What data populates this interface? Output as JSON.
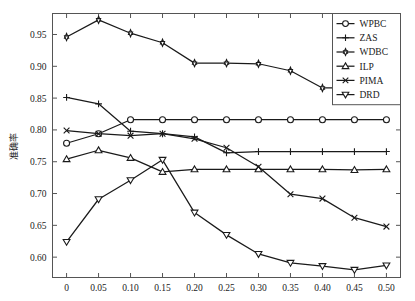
{
  "chart_data": {
    "type": "line",
    "title": "",
    "xlabel": "",
    "ylabel": "准确率",
    "x": [
      0,
      0.05,
      0.1,
      0.15,
      0.2,
      0.25,
      0.3,
      0.35,
      0.4,
      0.45,
      0.5
    ],
    "xticklabels": [
      "0",
      "0.05",
      "0.10",
      "0.15",
      "0.20",
      "0.25",
      "0.30",
      "0.35",
      "0.40",
      "0.45",
      "0.50"
    ],
    "yticks": [
      0.6,
      0.65,
      0.7,
      0.75,
      0.8,
      0.85,
      0.9,
      0.95
    ],
    "yticklabels": [
      "0.60",
      "0.65",
      "0.70",
      "0.75",
      "0.80",
      "0.85",
      "0.90",
      "0.95"
    ],
    "xlim": [
      -0.022,
      0.522
    ],
    "ylim": [
      0.568,
      0.983
    ],
    "grid": false,
    "legend_position": "upper right",
    "series": [
      {
        "name": "WPBC",
        "marker": "circle",
        "color": "#1a1a1a",
        "values": [
          0.779,
          0.794,
          0.816,
          0.816,
          0.816,
          0.816,
          0.816,
          0.816,
          0.816,
          0.816,
          0.816
        ]
      },
      {
        "name": "ZAS",
        "marker": "plus",
        "color": "#1a1a1a",
        "values": [
          0.851,
          0.841,
          0.798,
          0.794,
          0.789,
          0.764,
          0.766,
          0.766,
          0.766,
          0.766,
          0.766
        ]
      },
      {
        "name": "WDBC",
        "marker": "hexagram",
        "color": "#1a1a1a",
        "values": [
          0.946,
          0.973,
          0.952,
          0.937,
          0.905,
          0.905,
          0.904,
          0.893,
          0.866,
          0.866,
          0.866
        ]
      },
      {
        "name": "ILP",
        "marker": "triangle-up",
        "color": "#1a1a1a",
        "values": [
          0.754,
          0.768,
          0.756,
          0.734,
          0.738,
          0.738,
          0.738,
          0.738,
          0.738,
          0.737,
          0.738
        ]
      },
      {
        "name": "PIMA",
        "marker": "cross",
        "color": "#1a1a1a",
        "values": [
          0.799,
          0.794,
          0.791,
          0.794,
          0.786,
          0.772,
          0.742,
          0.699,
          0.692,
          0.662,
          0.648
        ]
      },
      {
        "name": "DRD",
        "marker": "triangle-down",
        "color": "#1a1a1a",
        "values": [
          0.624,
          0.691,
          0.721,
          0.753,
          0.67,
          0.635,
          0.605,
          0.591,
          0.586,
          0.58,
          0.587
        ]
      }
    ]
  },
  "figure": {
    "background": "#ffffff",
    "axis_color": "#555555",
    "line_color": "#1a1a1a"
  }
}
